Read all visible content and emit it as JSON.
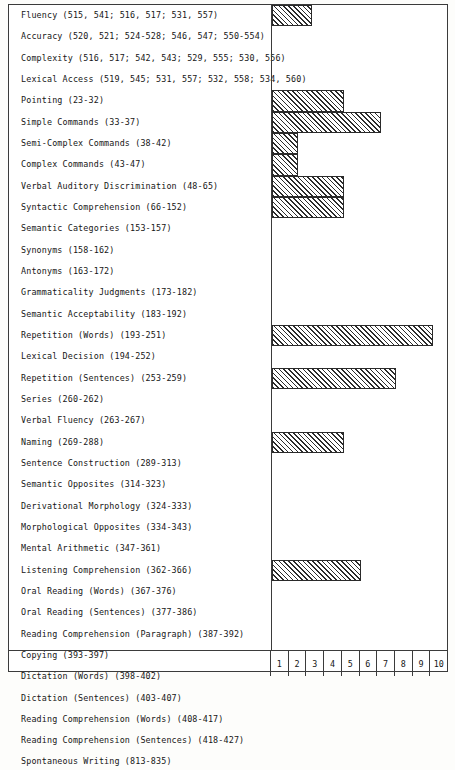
{
  "chart_data": {
    "type": "bar",
    "orientation": "horizontal",
    "title": "",
    "xlabel": "",
    "ylabel": "",
    "xlim": [
      0,
      10
    ],
    "grid": false,
    "legend": null,
    "axis_ticks": [
      "1",
      "2",
      "3",
      "4",
      "5",
      "6",
      "7",
      "8",
      "9",
      "10"
    ],
    "categories": [
      "Fluency (515, 541; 516, 517; 531, 557)",
      "Accuracy (520, 521; 524-528; 546, 547; 550-554)",
      "Complexity (516, 517; 542, 543; 529, 555; 530, 556)",
      "Lexical Access (519, 545; 531, 557; 532, 558; 534, 560)",
      "Pointing (23-32)",
      "Simple Commands (33-37)",
      "Semi-Complex Commands (38-42)",
      "Complex Commands (43-47)",
      "Verbal Auditory Discrimination (48-65)",
      "Syntactic Comprehension (66-152)",
      "Semantic Categories (153-157)",
      "Synonyms (158-162)",
      "Antonyms (163-172)",
      "Grammaticality Judgments (173-182)",
      "Semantic Acceptability (183-192)",
      "Repetition (Words) (193-251)",
      "Lexical Decision (194-252)",
      "Repetition (Sentences) (253-259)",
      "Series (260-262)",
      "Verbal Fluency (263-267)",
      "Naming (269-288)",
      "Sentence Construction (289-313)",
      "Semantic Opposites (314-323)",
      "Derivational Morphology (324-333)",
      "Morphological Opposites (334-343)",
      "Mental Arithmetic (347-361)",
      "Listening Comprehension (362-366)",
      "Oral Reading (Words) (367-376)",
      "Oral Reading (Sentences) (377-386)",
      "Reading Comprehension (Paragraph) (387-392)",
      "Copying (393-397)",
      "Dictation (Words) (398-402)",
      "Dictation (Sentences) (403-407)",
      "Reading Comprehension (Words) (408-417)",
      "Reading Comprehension (Sentences) (418-427)",
      "Spontaneous Writing (813-835)"
    ],
    "values": [
      2.3,
      0,
      0,
      0,
      4.1,
      6.2,
      1.5,
      1.5,
      4.1,
      4.1,
      0,
      0,
      0,
      0,
      0,
      9.2,
      0,
      7.1,
      0,
      0,
      4.1,
      0,
      0,
      0,
      0,
      0,
      5.1,
      0,
      0,
      0,
      0,
      0,
      0,
      0,
      0,
      0
    ]
  },
  "style": {
    "bar_fill": "#2b2b2b",
    "bar_border": "#2a2a2a",
    "frame_color": "#3b3b3b",
    "background": "#ffffff",
    "text_color": "#161616"
  }
}
